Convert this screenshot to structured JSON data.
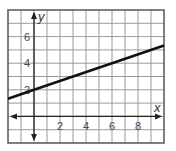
{
  "chart_data": {
    "type": "line",
    "title": "",
    "xlabel": "x",
    "ylabel": "y",
    "xlim": [
      -2,
      10
    ],
    "ylim": [
      -2,
      8
    ],
    "grid": true,
    "x_ticks": [
      2,
      4,
      6,
      8
    ],
    "y_ticks": [
      2,
      4,
      6
    ],
    "x_tick_labels": [
      "2",
      "4",
      "6",
      "8"
    ],
    "y_tick_labels": [
      "2",
      "4",
      "6"
    ],
    "series": [
      {
        "name": "line",
        "equation": "y = x/3 + 2",
        "x": [
          -2,
          0,
          3,
          6,
          10
        ],
        "y": [
          1.33,
          2,
          3,
          4,
          5.33
        ],
        "color": "#111111"
      }
    ],
    "legend": null
  },
  "colors": {
    "grid": "#9a9a9a",
    "border": "#555555",
    "axis": "#222222",
    "line": "#111111"
  }
}
